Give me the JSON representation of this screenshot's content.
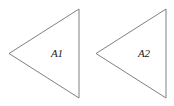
{
  "figure": {
    "type": "geometric-diagram",
    "width": 174,
    "height": 106,
    "background_color": "#ffffff",
    "stroke_color": "#808080",
    "label_color": "#1a1a1a",
    "shapes": [
      {
        "id": "triangle-a1",
        "name": "triangle",
        "label": "A1",
        "orientation": "left-pointing",
        "points": "9,53.5 79,9 79,98",
        "apex": [
          9,
          53.5
        ],
        "top_right": [
          79,
          9
        ],
        "bottom_right": [
          79,
          98
        ],
        "label_x": 57,
        "label_y": 54
      },
      {
        "id": "triangle-a2",
        "name": "triangle",
        "label": "A2",
        "orientation": "left-pointing",
        "points": "96,53.5 166,9 166,98",
        "apex": [
          96,
          53.5
        ],
        "top_right": [
          166,
          9
        ],
        "bottom_right": [
          166,
          98
        ],
        "label_x": 144,
        "label_y": 54
      }
    ]
  }
}
